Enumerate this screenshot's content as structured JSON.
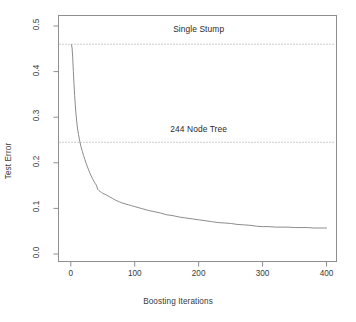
{
  "chart_data": {
    "type": "line",
    "title": "",
    "xlabel": "Boosting Iterations",
    "ylabel": "Test Error",
    "xlim": [
      0,
      400
    ],
    "ylim": [
      0.0,
      0.5
    ],
    "xticks": [
      0,
      100,
      200,
      300,
      400
    ],
    "xtick_labels": [
      "0",
      "100",
      "200",
      "300",
      "400"
    ],
    "yticks": [
      0.0,
      0.1,
      0.2,
      0.3,
      0.4,
      0.5
    ],
    "ytick_labels": [
      "0.0",
      "0.1",
      "0.2",
      "0.3",
      "0.4",
      "0.5"
    ],
    "grid": false,
    "legend": "none",
    "line_color": "#8c8c8c",
    "frame_color": "#8f8f8f",
    "reference_lines": [
      {
        "label": "Single Stump",
        "value": 0.46,
        "style": "dotted",
        "label_x": 200,
        "label_y": 0.5
      },
      {
        "label": "244 Node Tree",
        "value": 0.245,
        "style": "dotted",
        "label_x": 200,
        "label_y": 0.28
      }
    ],
    "series": [
      {
        "name": "AdaBoost test error",
        "x": [
          1,
          2,
          3,
          4,
          5,
          6,
          7,
          8,
          9,
          10,
          12,
          14,
          16,
          18,
          20,
          22,
          24,
          26,
          28,
          30,
          32,
          34,
          36,
          38,
          40,
          42,
          44,
          46,
          48,
          50,
          55,
          60,
          65,
          70,
          75,
          80,
          85,
          90,
          95,
          100,
          110,
          120,
          130,
          140,
          150,
          160,
          170,
          180,
          190,
          200,
          210,
          220,
          230,
          240,
          250,
          260,
          270,
          280,
          290,
          300,
          310,
          320,
          330,
          340,
          350,
          360,
          370,
          380,
          390,
          400
        ],
        "y": [
          0.459,
          0.452,
          0.43,
          0.4,
          0.372,
          0.348,
          0.327,
          0.309,
          0.294,
          0.281,
          0.262,
          0.247,
          0.235,
          0.225,
          0.216,
          0.207,
          0.199,
          0.191,
          0.184,
          0.177,
          0.171,
          0.165,
          0.16,
          0.155,
          0.151,
          0.142,
          0.139,
          0.137,
          0.135,
          0.133,
          0.13,
          0.126,
          0.122,
          0.118,
          0.115,
          0.112,
          0.11,
          0.108,
          0.106,
          0.104,
          0.1,
          0.096,
          0.093,
          0.09,
          0.086,
          0.084,
          0.081,
          0.079,
          0.077,
          0.075,
          0.073,
          0.071,
          0.069,
          0.068,
          0.067,
          0.065,
          0.064,
          0.063,
          0.061,
          0.06,
          0.06,
          0.059,
          0.059,
          0.059,
          0.058,
          0.058,
          0.058,
          0.057,
          0.057,
          0.057
        ]
      }
    ]
  },
  "axes": {
    "xlabel": "Boosting Iterations",
    "ylabel": "Test Error"
  }
}
